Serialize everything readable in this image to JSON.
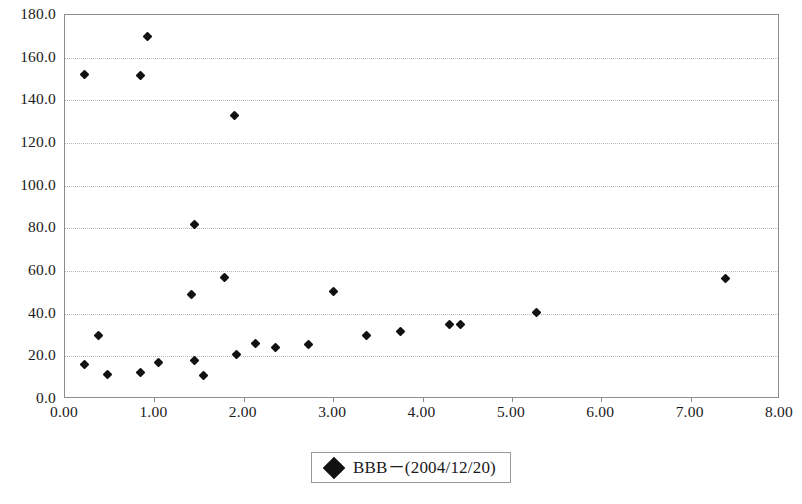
{
  "chart_data": {
    "type": "scatter",
    "title": "",
    "xlabel": "",
    "ylabel": "",
    "xlim": [
      0.0,
      8.0
    ],
    "ylim": [
      0.0,
      180.0
    ],
    "xticks": [
      "0.00",
      "1.00",
      "2.00",
      "3.00",
      "4.00",
      "5.00",
      "6.00",
      "7.00",
      "8.00"
    ],
    "xtick_values": [
      0,
      1,
      2,
      3,
      4,
      5,
      6,
      7,
      8
    ],
    "yticks": [
      "0.0",
      "20.0",
      "40.0",
      "60.0",
      "80.0",
      "100.0",
      "120.0",
      "140.0",
      "160.0",
      "180.0"
    ],
    "ytick_values": [
      0,
      20,
      40,
      60,
      80,
      100,
      120,
      140,
      160,
      180
    ],
    "gridlines": [
      20,
      40,
      60,
      80,
      100,
      120,
      140,
      160
    ],
    "grid": "horizontal-dotted",
    "legend_position": "bottom-center",
    "marker": "filled-diamond",
    "marker_color": "#111111",
    "series": [
      {
        "name": "BBB－(2004/12/20)",
        "points": [
          [
            0.22,
            152.0
          ],
          [
            0.22,
            16.0
          ],
          [
            0.37,
            30.0
          ],
          [
            0.47,
            11.5
          ],
          [
            0.85,
            151.5
          ],
          [
            0.85,
            12.5
          ],
          [
            0.92,
            170.0
          ],
          [
            1.05,
            17.0
          ],
          [
            1.42,
            49.0
          ],
          [
            1.45,
            82.0
          ],
          [
            1.45,
            18.0
          ],
          [
            1.55,
            11.0
          ],
          [
            1.78,
            57.0
          ],
          [
            1.9,
            133.0
          ],
          [
            1.92,
            21.0
          ],
          [
            2.13,
            26.0
          ],
          [
            2.35,
            24.0
          ],
          [
            2.72,
            25.5
          ],
          [
            3.0,
            50.5
          ],
          [
            3.37,
            30.0
          ],
          [
            3.75,
            31.5
          ],
          [
            4.3,
            35.0
          ],
          [
            4.42,
            35.0
          ],
          [
            5.28,
            40.5
          ],
          [
            7.39,
            56.5
          ]
        ]
      }
    ]
  },
  "legend": {
    "label": "BBB－(2004/12/20)"
  }
}
